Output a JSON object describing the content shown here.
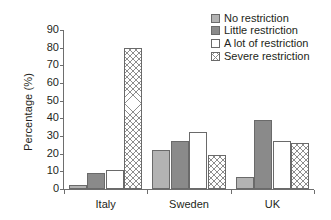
{
  "chart_data": {
    "type": "bar",
    "title": "",
    "xlabel": "",
    "ylabel": "Percentage (%)",
    "categories": [
      "Italy",
      "Sweden",
      "UK"
    ],
    "series": [
      {
        "name": "No restriction",
        "values": [
          2,
          22,
          7
        ],
        "fill": "light-gray",
        "color": "#b3b3b3"
      },
      {
        "name": "Little restriction",
        "values": [
          9,
          27,
          39
        ],
        "fill": "dark-gray",
        "color": "#8a8a8a"
      },
      {
        "name": "A lot of restriction",
        "values": [
          11,
          32,
          27
        ],
        "fill": "white",
        "color": "#ffffff"
      },
      {
        "name": "Severe restriction",
        "values": [
          80,
          19,
          26
        ],
        "fill": "crosshatch",
        "color": "#ffffff"
      }
    ],
    "ylim": [
      0,
      90
    ],
    "yticks": [
      0,
      10,
      20,
      30,
      40,
      50,
      60,
      70,
      80,
      90
    ],
    "ytick_labels": [
      "0",
      "10",
      "20",
      "30",
      "40",
      "50",
      "60",
      "70",
      "80",
      "90"
    ],
    "grid": false,
    "legend_position": "top-right",
    "legend_entries": [
      "No restriction",
      "Little restriction",
      "A lot of restriction",
      "Severe restriction"
    ]
  }
}
